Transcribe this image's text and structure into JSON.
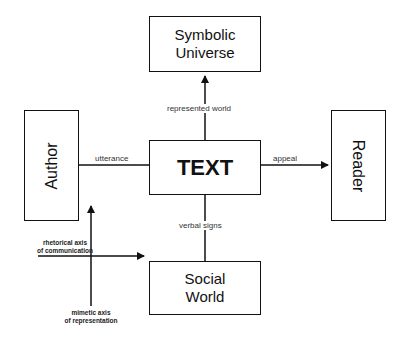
{
  "diagram": {
    "nodes": {
      "symbolic_universe": {
        "line1": "Symbolic",
        "line2": "Universe"
      },
      "author": {
        "label": "Author"
      },
      "text": {
        "label": "TEXT"
      },
      "reader": {
        "label": "Reader"
      },
      "social_world": {
        "line1": "Social",
        "line2": "World"
      }
    },
    "edges": {
      "represented_world": "represented world",
      "utterance": "utterance",
      "appeal": "appeal",
      "verbal_signs": "verbal signs"
    },
    "axes": {
      "rhetorical_line1": "rhetorical axis",
      "rhetorical_line2": "of communication",
      "mimetic_line1": "mimetic axis",
      "mimetic_line2": "of representation"
    }
  }
}
